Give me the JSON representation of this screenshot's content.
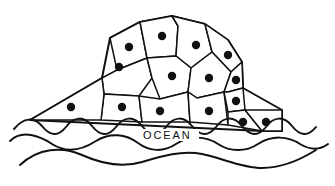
{
  "figure": {
    "background_color": "#ffffff",
    "line_color": "#111111",
    "dot_color": "#111111",
    "width": 335,
    "height": 186
  },
  "labels": {
    "ocean": "OCEAN"
  },
  "chart_data": {
    "type": "diagram",
    "island": {
      "outline": "M 30,120 L 102,78 L 110,38 L 140,22 L 172,16 L 205,24 L 228,40 L 242,62 L 243,88 L 282,110 L 282,131 L 262,131 L 30,120 Z",
      "waterline_y": 122
    },
    "cells": [
      {
        "id": "c1",
        "path": "M 110,38 L 140,22 L 147,58 L 117,70 Z",
        "dot": [
          129,
          47
        ]
      },
      {
        "id": "c2",
        "path": "M 140,22 L 172,16 L 178,26 L 176,56 L 147,58 Z",
        "dot": [
          162,
          36
        ]
      },
      {
        "id": "c3",
        "path": "M 172,16 L 205,24 L 212,52 L 191,68 L 176,56 L 178,26 Z",
        "dot": [
          196,
          45
        ]
      },
      {
        "id": "c4",
        "path": "M 205,24 L 228,40 L 242,62 L 231,72 L 212,52 Z",
        "dot": [
          228,
          55
        ]
      },
      {
        "id": "c5",
        "path": "M 102,78 L 117,70 L 147,58 L 152,78 L 139,96 L 104,94 Z",
        "dot": [
          119,
          67
        ]
      },
      {
        "id": "c6",
        "path": "M 147,58 L 176,56 L 191,68 L 188,92 L 160,99 L 152,78 Z",
        "dot": [
          172,
          76
        ]
      },
      {
        "id": "c7",
        "path": "M 191,68 L 212,52 L 231,72 L 224,92 L 197,98 L 188,92 Z",
        "dot": [
          209,
          78
        ]
      },
      {
        "id": "c8",
        "path": "M 231,72 L 242,62 L 243,88 L 228,92 L 224,92 Z",
        "dot": [
          236,
          80
        ]
      },
      {
        "id": "c9",
        "path": "M 104,94 L 139,96 L 142,122 L 101,120 Z",
        "dot": [
          122,
          107
        ]
      },
      {
        "id": "c10",
        "path": "M 139,96 L 160,99 L 188,92 L 190,122 L 142,122 Z",
        "dot": [
          160,
          111
        ]
      },
      {
        "id": "c11",
        "path": "M 188,92 L 197,98 L 224,92 L 228,125 L 190,122 Z",
        "dot": [
          209,
          111
        ]
      },
      {
        "id": "c12",
        "path": "M 224,92 L 228,92 L 243,88 L 245,110 L 228,112 Z",
        "dot": [
          236,
          101
        ]
      },
      {
        "id": "c13",
        "path": "M 228,112 L 245,110 L 262,131 L 228,125 Z",
        "dot": [
          243,
          122
        ]
      },
      {
        "id": "c14",
        "path": "M 245,110 L 282,110 L 282,131 L 262,131 Z",
        "dot": [
          266,
          122
        ]
      },
      {
        "id": "c15",
        "path": "M 30,120 L 102,78 L 104,94 L 101,120 Z",
        "dot": [
          71,
          107
        ]
      }
    ],
    "cell_count": 15,
    "dot_count": 15,
    "dot_radius": 4.2,
    "waves": [
      {
        "id": "wave-front",
        "path": "M 14,129 C 24,117 34,117 42,126 C 50,136 58,137 66,127 C 74,116 84,116 92,126 C 100,136 108,137 116,127 C 124,116 134,116 142,126 C 150,136 158,137 166,127 C 174,116 184,116 192,126 C 200,136 208,137 216,127 C 224,116 234,116 242,126 C 250,136 258,137 266,127 C 274,116 284,116 292,126 C 300,136 308,137 316,127"
      },
      {
        "id": "wave-middle",
        "path": "M 10,141 C 22,129 40,136 52,144 C 66,153 82,150 96,141 C 110,132 126,134 138,143 C 150,152 164,152 176,144 C 190,135 206,136 218,144 C 230,152 246,152 258,144 C 272,135 288,136 300,144 C 310,150 320,150 328,144"
      },
      {
        "id": "wave-back",
        "path": "M 20,165 C 38,148 62,146 82,155 C 102,164 122,168 142,162 C 162,156 182,150 202,154 C 222,158 242,168 262,168 C 282,168 300,160 316,150"
      }
    ],
    "wave_count": 3,
    "annotations": [
      {
        "text": "OCEAN",
        "x": 143,
        "y": 139,
        "letter_spacing": 1.9,
        "font_size": 11
      }
    ]
  }
}
